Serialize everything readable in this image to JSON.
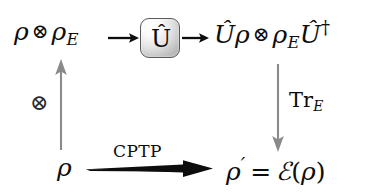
{
  "figure": {
    "name": "quantum-channel-stinespring-dilation-diagram",
    "background_color": "#ffffff",
    "width": 377,
    "height": 192
  },
  "nodes": {
    "input_state": {
      "label": "ρ ⊗ ρ_E",
      "rho": "ρ",
      "otimes": "⊗",
      "rho_env": "ρ",
      "env_subscript": "E"
    },
    "unitary_box": {
      "label": "Û",
      "u_hat": "Û",
      "border_color": "#5a5a5a",
      "fill_light": "#ffffff",
      "fill_dark": "#a8a8a8"
    },
    "evolved_state": {
      "label": "Û ρ ⊗ ρ_E Û†",
      "u_hat": "Û",
      "rho": "ρ",
      "otimes": "⊗",
      "rho_env": "ρ",
      "env_subscript": "E",
      "u_hat_dagger": "Û",
      "dagger": "†"
    },
    "reduced_input": {
      "label": "ρ",
      "rho": "ρ"
    },
    "output_state": {
      "label": "ρ′ = ℰ(ρ)",
      "rho_prime": "ρ",
      "prime": "′",
      "equals": "=",
      "channel": "ℰ",
      "open_paren": "(",
      "rho": "ρ",
      "close_paren": ")"
    }
  },
  "edges": {
    "tensor_up": {
      "label": "⊗",
      "direction": "up",
      "color": "#808080",
      "style": "thin-gray"
    },
    "into_unitary": {
      "label": "",
      "direction": "right",
      "color": "#000000",
      "style": "thin-black"
    },
    "out_of_unitary": {
      "label": "",
      "direction": "right",
      "color": "#000000",
      "style": "thin-black"
    },
    "partial_trace": {
      "label": "Tr",
      "label_subscript": "E",
      "direction": "down",
      "color": "#808080",
      "style": "thin-gray"
    },
    "cptp_map": {
      "label": "CPTP",
      "direction": "right",
      "color": "#000000",
      "style": "thick-black-wedge"
    }
  }
}
